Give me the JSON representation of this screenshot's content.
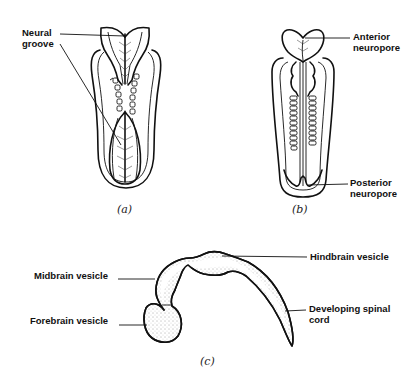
{
  "figure": {
    "panels": [
      {
        "id": "a",
        "caption": "(a)",
        "labels": [
          {
            "text": "Neural\ngroove",
            "target": "neural groove (open folds, anterior and posterior)"
          }
        ]
      },
      {
        "id": "b",
        "caption": "(b)",
        "labels": [
          {
            "text": "Anterior\nneuropore",
            "target": "anterior neuropore"
          },
          {
            "text": "Posterior\nneuropore",
            "target": "posterior neuropore"
          }
        ]
      },
      {
        "id": "c",
        "caption": "(c)",
        "labels": [
          {
            "text": "Midbrain vesicle",
            "target": "midbrain vesicle"
          },
          {
            "text": "Forebrain vesicle",
            "target": "forebrain vesicle"
          },
          {
            "text": "Hindbrain vesicle",
            "target": "hindbrain vesicle"
          },
          {
            "text": "Developing spinal\ncord",
            "target": "developing spinal cord"
          }
        ]
      }
    ]
  },
  "colors": {
    "ink": "#111111",
    "background": "#ffffff"
  }
}
